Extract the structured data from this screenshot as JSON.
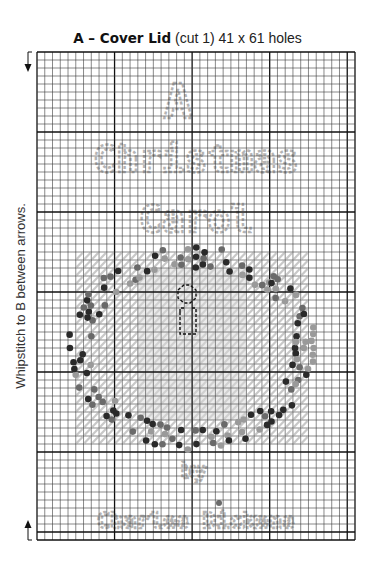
{
  "title": {
    "label": "A – Cover Lid",
    "detail": "(cut 1) 41 x 61 holes"
  },
  "side_note": "Whipstitch to B between arrows.",
  "grid": {
    "columns": 41,
    "rows": 61,
    "major_every": 10,
    "line_color": "#3a3a3a",
    "major_line_color": "#111111"
  },
  "pattern_text": {
    "top_lines": [
      "A",
      "Christmas",
      "Carol"
    ],
    "byline": "by",
    "author": "Charles Dickens",
    "text_stitch_color": "#b4b4b4"
  },
  "wreath": {
    "background_stitch_color": "#c8c8c8",
    "dark_color": "#2a2a2a",
    "mid_color": "#6a6a6a",
    "light_color": "#9a9a9a",
    "candle_outline_color": "#111111"
  },
  "arrows": {
    "top": "down-arrow",
    "bottom": "up-arrow"
  }
}
